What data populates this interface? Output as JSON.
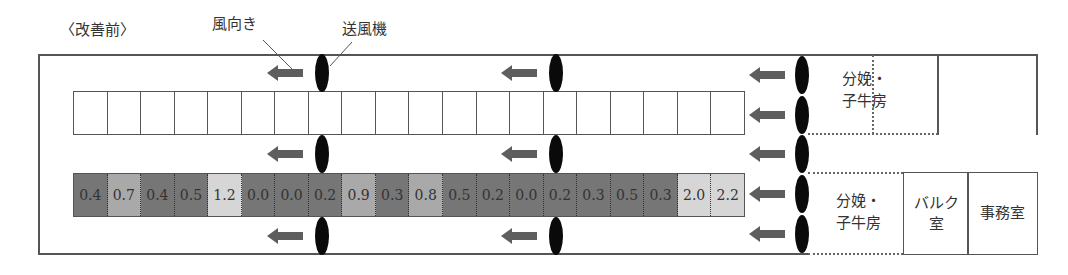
{
  "diagram": {
    "title": "〈改善前〉",
    "labels": {
      "wind_direction": "風向き",
      "fan": "送風機"
    },
    "rooms": {
      "calving_top": [
        "分娩・",
        "子牛房"
      ],
      "calving_bottom": [
        "分娩・",
        "子牛房"
      ],
      "bulk": [
        "バルク",
        "室"
      ],
      "office": "事務室"
    },
    "stall_row_top": {
      "cells": 20
    },
    "stall_row_bottom": {
      "values": [
        "0.4",
        "0.7",
        "0.4",
        "0.5",
        "1.2",
        "0.0",
        "0.0",
        "0.2",
        "0.9",
        "0.3",
        "0.8",
        "0.5",
        "0.2",
        "0.0",
        "0.2",
        "0.3",
        "0.5",
        "0.3",
        "2.0",
        "2.2"
      ]
    },
    "colors": {
      "low": "#767676",
      "mid": "#a9a9a9",
      "high": "#d6d6d6",
      "fan": "#0a0a0a",
      "arrow": "#5e5e5e"
    },
    "shade_thresholds": {
      "mid_min": 0.6,
      "high_min": 1.0
    },
    "fan_columns_x": [
      322,
      556,
      802
    ],
    "fan_rows_y": [
      54,
      135,
      217
    ],
    "right_fan_rows_y": [
      56,
      96,
      135,
      175,
      215
    ]
  }
}
